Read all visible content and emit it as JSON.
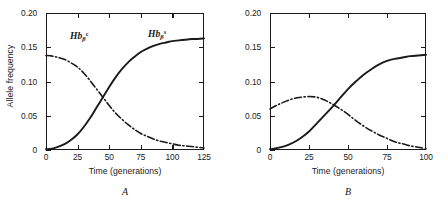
{
  "figure": {
    "axis_title_x": "Time (generations)",
    "axis_title_y": "Allele frequency",
    "label_hbc_html": "Hb",
    "label_hbc_sub": "β",
    "label_hbc_sup": "c",
    "label_hbs_sup": "s",
    "caption_a": "A",
    "caption_b": "B",
    "line_color": "#1a1a1a"
  },
  "panel_a": {
    "caption": "A",
    "xticks": [
      "0",
      "25",
      "50",
      "75",
      "100",
      "125"
    ],
    "yticks": [
      "0",
      "0.05",
      "0.10",
      "0.15",
      "0.20"
    ],
    "xlabel": "Time (generations)",
    "ylabel": "Allele frequency"
  },
  "panel_b": {
    "caption": "B",
    "xticks": [
      "0",
      "25",
      "50",
      "75",
      "100"
    ],
    "yticks": [
      "0",
      "0.05",
      "0.10",
      "0.15",
      "0.20"
    ],
    "xlabel": "Time (generations)",
    "ylabel": "Allele frequency"
  },
  "chart_data": [
    {
      "type": "line",
      "panel": "A",
      "title": "",
      "xlabel": "Time (generations)",
      "ylabel": "Allele frequency",
      "xlim": [
        0,
        125
      ],
      "ylim": [
        0,
        0.2
      ],
      "xticks": [
        0,
        25,
        50,
        75,
        100,
        125
      ],
      "yticks": [
        0,
        0.05,
        0.1,
        0.15,
        0.2
      ],
      "grid": false,
      "legend": "inline-annotations",
      "annotations": [
        {
          "text": "Hb_beta^c",
          "x": 22,
          "y": 0.152
        },
        {
          "text": "Hb_beta^s",
          "x": 86,
          "y": 0.158
        }
      ],
      "series": [
        {
          "name": "Hb_beta^c",
          "style": "dash-dot",
          "x": [
            0,
            5,
            10,
            15,
            20,
            25,
            30,
            35,
            40,
            45,
            50,
            55,
            60,
            65,
            70,
            75,
            80,
            85,
            90,
            95,
            100,
            105,
            110,
            115,
            120,
            125
          ],
          "values": [
            0.138,
            0.137,
            0.135,
            0.132,
            0.127,
            0.121,
            0.112,
            0.101,
            0.089,
            0.077,
            0.065,
            0.054,
            0.045,
            0.037,
            0.03,
            0.024,
            0.02,
            0.016,
            0.013,
            0.011,
            0.009,
            0.007,
            0.006,
            0.005,
            0.004,
            0.003
          ]
        },
        {
          "name": "Hb_beta^s",
          "style": "solid",
          "x": [
            0,
            5,
            10,
            15,
            20,
            25,
            30,
            35,
            40,
            45,
            50,
            55,
            60,
            65,
            70,
            75,
            80,
            85,
            90,
            95,
            100,
            105,
            110,
            115,
            120,
            125
          ],
          "values": [
            0.001,
            0.002,
            0.005,
            0.009,
            0.015,
            0.023,
            0.034,
            0.047,
            0.062,
            0.077,
            0.092,
            0.106,
            0.118,
            0.128,
            0.136,
            0.143,
            0.148,
            0.152,
            0.155,
            0.157,
            0.159,
            0.16,
            0.161,
            0.162,
            0.162,
            0.163
          ]
        }
      ]
    },
    {
      "type": "line",
      "panel": "B",
      "title": "",
      "xlabel": "Time (generations)",
      "ylabel": "Allele frequency",
      "xlim": [
        0,
        100
      ],
      "ylim": [
        0,
        0.2
      ],
      "xticks": [
        0,
        25,
        50,
        75,
        100
      ],
      "yticks": [
        0,
        0.05,
        0.1,
        0.15,
        0.2
      ],
      "grid": false,
      "legend": "inline-annotations",
      "annotations": [
        {
          "text": "Hb_beta^c",
          "x": 22,
          "y": 0.098
        },
        {
          "text": "Hb_beta^s",
          "x": 70,
          "y": 0.122
        }
      ],
      "series": [
        {
          "name": "Hb_beta^c",
          "style": "dash-dot",
          "x": [
            0,
            5,
            10,
            15,
            20,
            25,
            30,
            35,
            40,
            45,
            50,
            55,
            60,
            65,
            70,
            75,
            80,
            85,
            90,
            95,
            100
          ],
          "values": [
            0.06,
            0.066,
            0.071,
            0.075,
            0.077,
            0.078,
            0.077,
            0.073,
            0.067,
            0.06,
            0.052,
            0.043,
            0.035,
            0.028,
            0.022,
            0.017,
            0.012,
            0.009,
            0.006,
            0.004,
            0.002
          ]
        },
        {
          "name": "Hb_beta^s",
          "style": "solid",
          "x": [
            0,
            5,
            10,
            15,
            20,
            25,
            30,
            35,
            40,
            45,
            50,
            55,
            60,
            65,
            70,
            75,
            80,
            85,
            90,
            95,
            100
          ],
          "values": [
            0.001,
            0.003,
            0.006,
            0.011,
            0.018,
            0.027,
            0.039,
            0.051,
            0.063,
            0.076,
            0.089,
            0.1,
            0.11,
            0.118,
            0.125,
            0.13,
            0.133,
            0.135,
            0.137,
            0.138,
            0.139
          ]
        }
      ]
    }
  ]
}
